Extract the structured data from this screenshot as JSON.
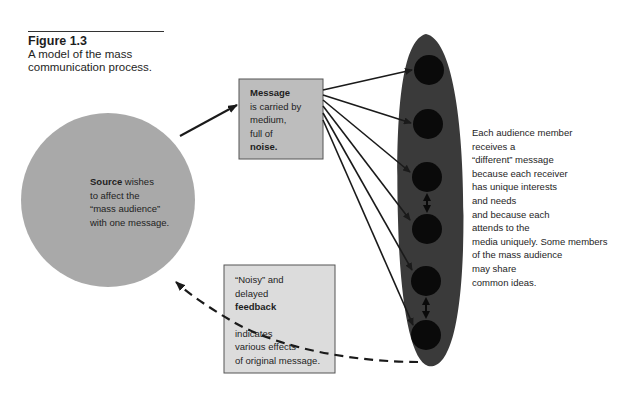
{
  "figure": {
    "number": "Figure 1.3",
    "caption_line1": "A model of the mass",
    "caption_line2": "communication process."
  },
  "source": {
    "title": "Source",
    "line1_rest": " wishes",
    "line2": "to affect the",
    "line3": "“mass audience”",
    "line4": "with one message."
  },
  "message": {
    "title": "Message",
    "line2": "is carried by",
    "line3": "medium,",
    "line4": "full of",
    "line5": "noise."
  },
  "feedback": {
    "line1": "“Noisy” and",
    "line2": "delayed",
    "title": "feedback",
    "line4": "indicates",
    "line5": "various effects",
    "line6": "of original message."
  },
  "audience": {
    "member_count": 6,
    "lines": [
      "Each audience member",
      "receives a",
      "“different” message",
      "because each receiver",
      "has unique interests",
      "and needs",
      "and because each",
      "attends to the",
      "media uniquely. Some members",
      "of the mass audience",
      "may share",
      "common ideas."
    ]
  },
  "colors": {
    "source_circle": "#a9a9a9",
    "message_box": "#bdbdbd",
    "feedback_box": "#dcdcdc",
    "audience_ellipse": "#3a3a3a",
    "audience_member": "#0a0a0a",
    "arrow": "#1a1a1a"
  }
}
